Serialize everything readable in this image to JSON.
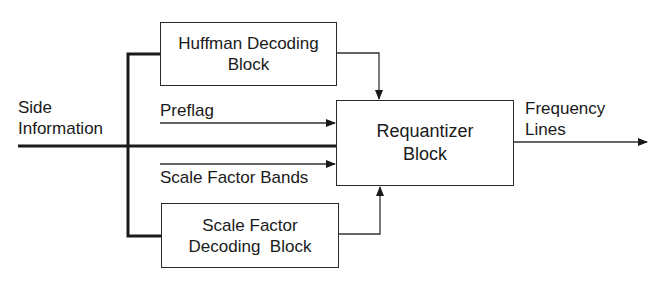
{
  "diagram": {
    "type": "block-diagram",
    "inputs": {
      "side_information": {
        "line1": "Side",
        "line2": "Information"
      }
    },
    "blocks": {
      "huffman": {
        "line1": "Huffman Decoding",
        "line2": "Block"
      },
      "requantizer": {
        "line1": "Requantizer",
        "line2": "Block"
      },
      "scale_factor_decoding": {
        "line1": "Scale Factor",
        "line2": "Decoding  Block"
      }
    },
    "signals": {
      "preflag": "Preflag",
      "scale_factor_bands": "Scale Factor Bands",
      "frequency_lines": {
        "line1": "Frequency",
        "line2": "Lines"
      }
    },
    "edges": [
      {
        "from": "side_information",
        "to": "huffman"
      },
      {
        "from": "side_information",
        "to": "requantizer",
        "label": "Preflag"
      },
      {
        "from": "side_information",
        "to": "requantizer"
      },
      {
        "from": "side_information",
        "to": "requantizer",
        "label": "Scale Factor Bands"
      },
      {
        "from": "side_information",
        "to": "scale_factor_decoding"
      },
      {
        "from": "huffman",
        "to": "requantizer"
      },
      {
        "from": "scale_factor_decoding",
        "to": "requantizer"
      },
      {
        "from": "requantizer",
        "to": "output",
        "label": "Frequency Lines"
      }
    ]
  }
}
